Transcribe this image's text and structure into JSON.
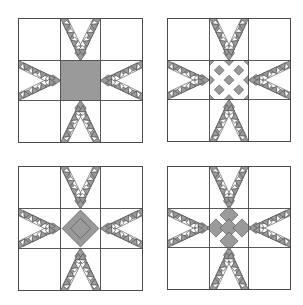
{
  "figure": {
    "title": "",
    "background": "#ffffff",
    "line_color": "#4a4a4a",
    "shade_color": "#9a9a9a",
    "fill_pattern": "crosshatch"
  },
  "blocks": [
    {
      "id": "top-left",
      "x": 18,
      "y": 18,
      "size": 124,
      "center": "solid-square"
    },
    {
      "id": "top-right",
      "x": 167,
      "y": 18,
      "size": 123,
      "center": "checker-diamonds"
    },
    {
      "id": "bottom-left",
      "x": 18,
      "y": 166,
      "size": 124,
      "center": "on-point-star"
    },
    {
      "id": "bottom-right",
      "x": 167,
      "y": 166,
      "size": 123,
      "center": "diamond-nine-patch"
    }
  ],
  "feathers_per_side": 4
}
